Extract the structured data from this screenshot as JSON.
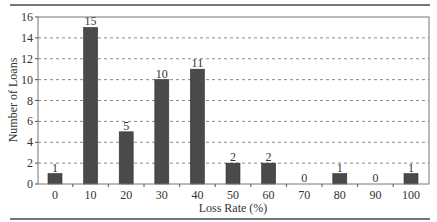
{
  "chart_data": {
    "type": "bar",
    "title": "",
    "xlabel": "Loss Rate (%)",
    "ylabel": "Number of Loans",
    "categories": [
      "0",
      "10",
      "20",
      "30",
      "40",
      "50",
      "60",
      "70",
      "80",
      "90",
      "100"
    ],
    "values": [
      1,
      15,
      5,
      10,
      11,
      2,
      2,
      0,
      1,
      0,
      1
    ],
    "data_labels": [
      "1",
      "15",
      "5",
      "10",
      "11",
      "2",
      "2",
      "0",
      "1",
      "0",
      "1"
    ],
    "ylim": [
      0,
      16
    ],
    "yticks": [
      0,
      2,
      4,
      6,
      8,
      10,
      12,
      14,
      16
    ],
    "grid": {
      "y": true,
      "style": "dashed"
    },
    "legend": null,
    "colors": {
      "bar": "#4a4a4a",
      "grid": "#8a8a8a",
      "frame": "#777777",
      "rule": "#777777"
    }
  }
}
